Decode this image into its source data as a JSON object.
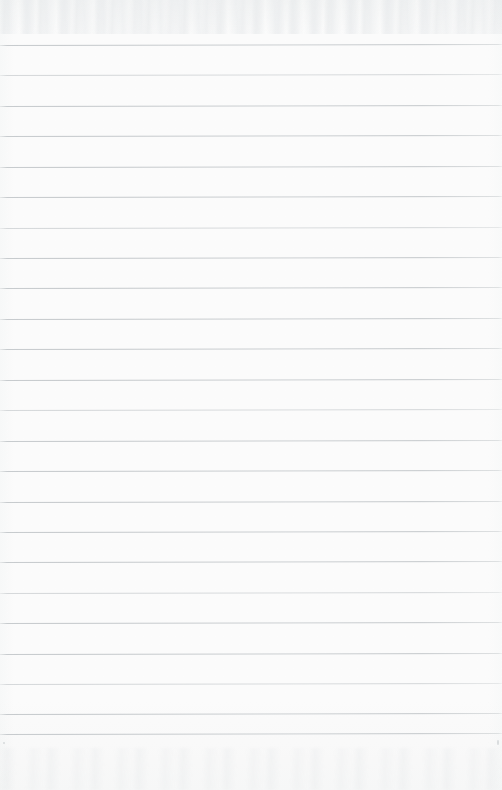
{
  "document": {
    "type": "scanned-ruled-paper",
    "title": "Blank lined notebook page",
    "width_px": 502,
    "height_px": 790,
    "paper_color": "#fcfcfc",
    "rule_color": "#c5c9cc",
    "content_text": "",
    "handwriting": "none",
    "margin_rule": "none",
    "orientation": "portrait"
  },
  "ruling": {
    "line_count": 24,
    "first_line_y": 45,
    "last_line_y": 734,
    "spacing_px": 30.4,
    "line_thickness_px": 1,
    "left_inset_px": 0,
    "right_inset_px": 0,
    "tilt_deg": -0.1,
    "lines_y": [
      45,
      75,
      106,
      136,
      167,
      197,
      228,
      258,
      288,
      319,
      349,
      380,
      410,
      441,
      471,
      502,
      532,
      562,
      593,
      623,
      654,
      684,
      714,
      734
    ],
    "faint_line_indices": [
      1,
      6,
      12,
      18,
      21
    ]
  },
  "artifacts": {
    "top_ghosting": "faint scanner bleed-through band along the upper edge",
    "bottom_ghosting": "faint scanner bleed-through band along the lower edge",
    "specks": [
      {
        "x": 497,
        "y": 740,
        "w": 2,
        "h": 5
      },
      {
        "x": 3,
        "y": 742,
        "w": 2,
        "h": 2
      }
    ]
  }
}
